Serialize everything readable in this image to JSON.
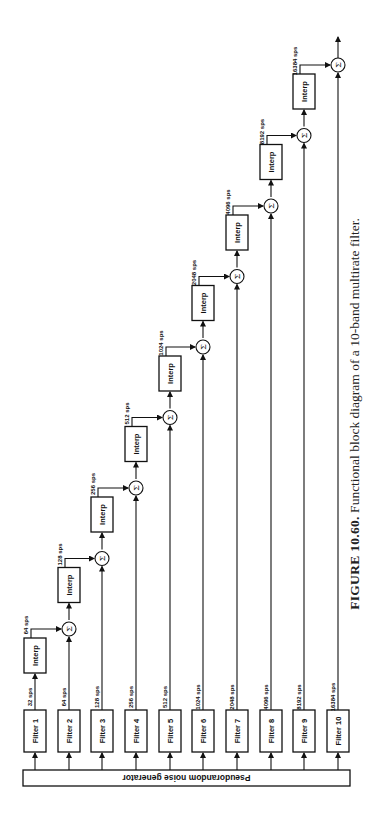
{
  "figure": {
    "number": "FIGURE 10.60.",
    "caption": "Functional block diagram of a 10-band multirate filter."
  },
  "generator": {
    "label": "Pseudorandom noise generator"
  },
  "filters": [
    {
      "label": "Filter 1",
      "rate": "32 sps"
    },
    {
      "label": "Filter 2",
      "rate": "64 sps"
    },
    {
      "label": "Filter 3",
      "rate": "128 sps"
    },
    {
      "label": "Filter 4",
      "rate": "256 sps"
    },
    {
      "label": "Filter 5",
      "rate": "512 sps"
    },
    {
      "label": "Filter 6",
      "rate": "1024 sps"
    },
    {
      "label": "Filter 7",
      "rate": "2048 sps"
    },
    {
      "label": "Filter 8",
      "rate": "4096 sps"
    },
    {
      "label": "Filter 9",
      "rate": "8192 sps"
    },
    {
      "label": "Filter 10",
      "rate": "16384 sps"
    }
  ],
  "interps": [
    {
      "label": "Interp",
      "rate": "64 sps"
    },
    {
      "label": "Interp",
      "rate": "128 sps"
    },
    {
      "label": "Interp",
      "rate": "256 sps"
    },
    {
      "label": "Interp",
      "rate": "512 sps"
    },
    {
      "label": "Interp",
      "rate": "1024 sps"
    },
    {
      "label": "Interp",
      "rate": "2048 sps"
    },
    {
      "label": "Interp",
      "rate": "4096 sps"
    },
    {
      "label": "Interp",
      "rate": "8192 sps"
    },
    {
      "label": "Interp",
      "rate": "16384 sps"
    }
  ],
  "summer_symbol": "Σ"
}
